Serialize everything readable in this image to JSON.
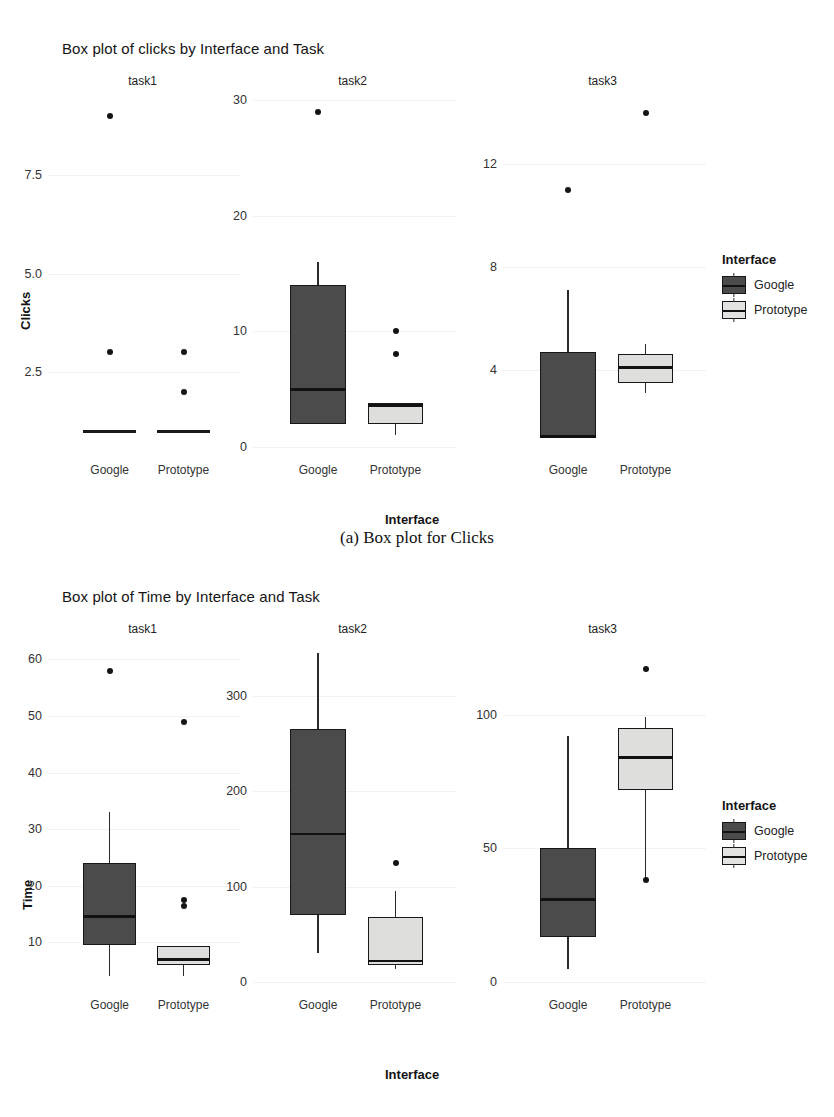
{
  "figures": [
    {
      "id": "clicks",
      "title": "Box plot of clicks by Interface and Task",
      "ylabel": "Clicks",
      "xlabel": "Interface",
      "caption": "(a) Box plot for Clicks",
      "legend": {
        "title": "Interface",
        "items": [
          "Google",
          "Prototype"
        ]
      },
      "colors": {
        "google": "#4b4b4b",
        "prototype": "#dededc",
        "outline": "#171717"
      },
      "chart_data": {
        "type": "box",
        "title": "Box plot of clicks by Interface and Task",
        "xlabel": "Interface",
        "ylabel": "Clicks",
        "facets": [
          "task1",
          "task2",
          "task3"
        ],
        "groups": [
          "Google",
          "Prototype"
        ],
        "panels": [
          {
            "facet": "task1",
            "ylim": [
              0.6,
              9.4
            ],
            "yticks": [
              2.5,
              5.0,
              7.5
            ],
            "ytick_labels": [
              "2.5",
              "5.0",
              "7.5"
            ],
            "boxes": [
              {
                "group": "Google",
                "min": 1,
                "q1": 1,
                "median": 1,
                "q3": 1,
                "max": 1,
                "outliers": [
                  3,
                  9
                ]
              },
              {
                "group": "Prototype",
                "min": 1,
                "q1": 1,
                "median": 1,
                "q3": 1,
                "max": 1,
                "outliers": [
                  2,
                  3
                ]
              }
            ]
          },
          {
            "facet": "task2",
            "ylim": [
              0,
              30
            ],
            "yticks": [
              0,
              10,
              20,
              30
            ],
            "ytick_labels": [
              "0",
              "10",
              "20",
              "30"
            ],
            "boxes": [
              {
                "group": "Google",
                "min": 2,
                "q1": 2,
                "median": 5,
                "q3": 14,
                "max": 16,
                "outliers": [
                  29
                ]
              },
              {
                "group": "Prototype",
                "min": 1,
                "q1": 2,
                "median": 3.6,
                "q3": 3.8,
                "max": 3.8,
                "outliers": [
                  8,
                  10
                ]
              }
            ]
          },
          {
            "facet": "task3",
            "ylim": [
              1,
              14.5
            ],
            "yticks": [
              4,
              8,
              12
            ],
            "ytick_labels": [
              "4",
              "8",
              "12"
            ],
            "boxes": [
              {
                "group": "Google",
                "min": 1.4,
                "q1": 1.4,
                "median": 1.4,
                "q3": 4.7,
                "max": 7.1,
                "outliers": [
                  11
                ]
              },
              {
                "group": "Prototype",
                "min": 3.1,
                "q1": 3.5,
                "median": 4.1,
                "q3": 4.6,
                "max": 5.0,
                "outliers": [
                  14
                ]
              }
            ]
          }
        ]
      }
    },
    {
      "id": "time",
      "title": "Box plot of Time by Interface and Task",
      "ylabel": "Time",
      "xlabel": "Interface",
      "caption": "",
      "legend": {
        "title": "Interface",
        "items": [
          "Google",
          "Prototype"
        ]
      },
      "colors": {
        "google": "#4b4b4b",
        "prototype": "#dededc",
        "outline": "#171717"
      },
      "chart_data": {
        "type": "box",
        "title": "Box plot of Time by Interface and Task",
        "xlabel": "Interface",
        "ylabel": "Time",
        "facets": [
          "task1",
          "task2",
          "task3"
        ],
        "groups": [
          "Google",
          "Prototype"
        ],
        "panels": [
          {
            "facet": "task1",
            "ylim": [
              3,
              62
            ],
            "yticks": [
              10,
              20,
              30,
              40,
              50,
              60
            ],
            "ytick_labels": [
              "10",
              "20",
              "30",
              "40",
              "50",
              "60"
            ],
            "boxes": [
              {
                "group": "Google",
                "min": 4,
                "q1": 9.5,
                "median": 14.5,
                "q3": 24,
                "max": 33,
                "outliers": [
                  58
                ]
              },
              {
                "group": "Prototype",
                "min": 4,
                "q1": 6,
                "median": 7,
                "q3": 9.3,
                "max": 9.3,
                "outliers": [
                  16.5,
                  17.5,
                  49
                ]
              }
            ]
          },
          {
            "facet": "task2",
            "ylim": [
              0,
              350
            ],
            "yticks": [
              0,
              100,
              200,
              300
            ],
            "ytick_labels": [
              "0",
              "100",
              "200",
              "300"
            ],
            "boxes": [
              {
                "group": "Google",
                "min": 30,
                "q1": 70,
                "median": 155,
                "q3": 265,
                "max": 345,
                "outliers": []
              },
              {
                "group": "Prototype",
                "min": 14,
                "q1": 18,
                "median": 22,
                "q3": 68,
                "max": 95,
                "outliers": [
                  125
                ]
              }
            ]
          },
          {
            "facet": "task3",
            "ylim": [
              0,
              125
            ],
            "yticks": [
              0,
              50,
              100
            ],
            "ytick_labels": [
              "0",
              "50",
              "100"
            ],
            "boxes": [
              {
                "group": "Google",
                "min": 5,
                "q1": 17,
                "median": 31,
                "q3": 50,
                "max": 92,
                "outliers": []
              },
              {
                "group": "Prototype",
                "min": 38,
                "q1": 72,
                "median": 84,
                "q3": 95,
                "max": 99,
                "outliers": [
                  38,
                  117
                ]
              }
            ]
          }
        ]
      }
    }
  ]
}
